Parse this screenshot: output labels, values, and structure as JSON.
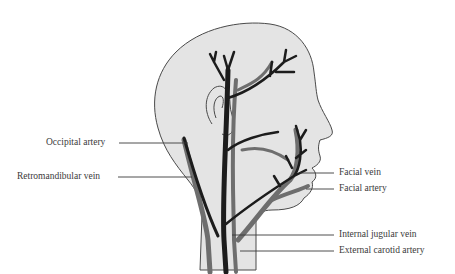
{
  "figure": {
    "colors": {
      "skin_fill": "#e4e4e4",
      "outline": "#4a4a4a",
      "artery": "#1c1c1c",
      "vein": "#6e6e6e",
      "leader_line": "#3a3a3a",
      "label_text": "#3a3a3a"
    }
  },
  "labels": {
    "left": [
      {
        "id": "occipital-artery",
        "text": "Occipital artery"
      },
      {
        "id": "retromandibular-vein",
        "text": "Retromandibular vein"
      }
    ],
    "right": [
      {
        "id": "facial-vein",
        "text": "Facial vein"
      },
      {
        "id": "facial-artery",
        "text": "Facial artery"
      },
      {
        "id": "internal-jugular-vein",
        "text": "Internal jugular vein"
      },
      {
        "id": "external-carotid-artery",
        "text": "External carotid artery"
      }
    ]
  }
}
